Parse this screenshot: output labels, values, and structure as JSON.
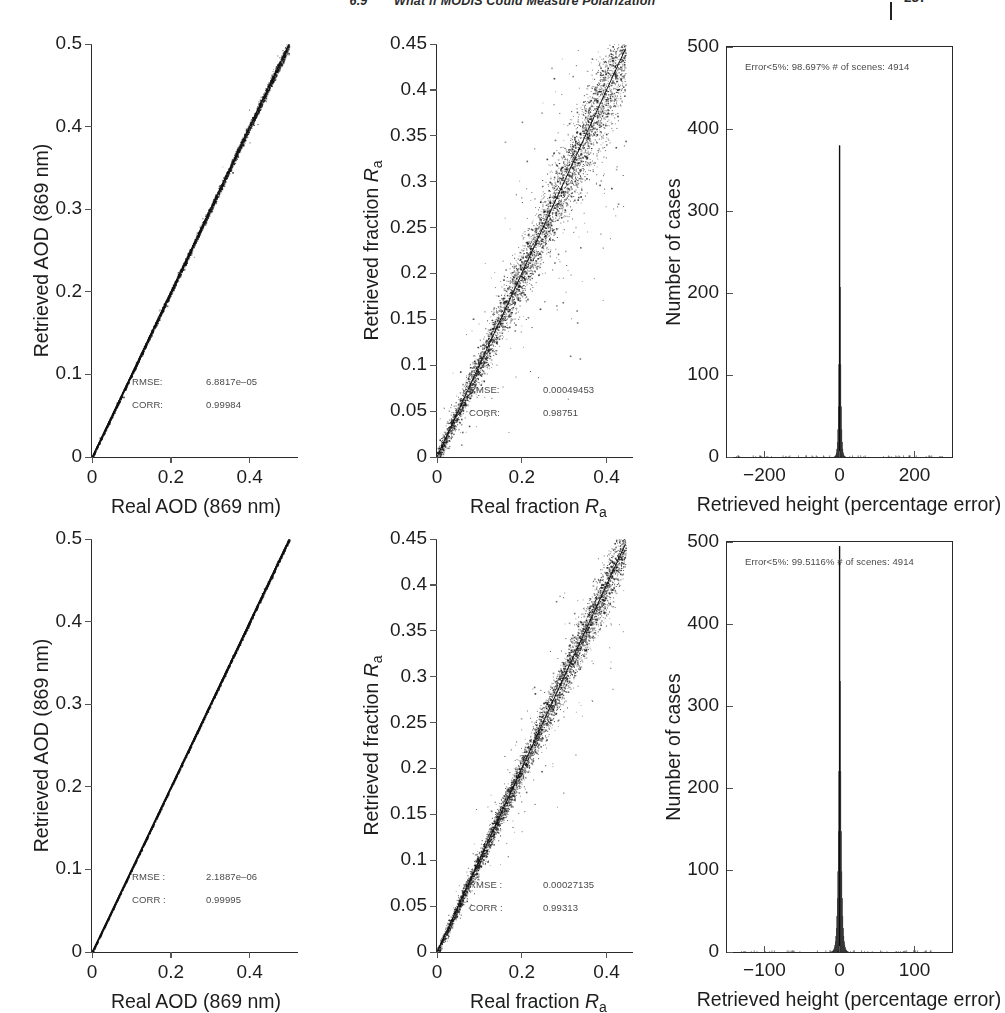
{
  "header": {
    "section": "6.9",
    "title": "What if MODIS Could Measure Polarization",
    "page": "237"
  },
  "chart_data": [
    {
      "id": "panel-top-left",
      "type": "scatter",
      "title": "",
      "xlabel": "Real AOD (869 nm)",
      "ylabel": "Retrieved AOD (869 nm)",
      "xlim": [
        0,
        0.52
      ],
      "ylim": [
        0,
        0.5
      ],
      "xticks": [
        0,
        0.2,
        0.4
      ],
      "xticklabels": [
        "0",
        "0.2",
        "0.4"
      ],
      "yticks": [
        0,
        0.1,
        0.2,
        0.3,
        0.4,
        0.5
      ],
      "yticklabels": [
        "0",
        "0.1",
        "0.2",
        "0.3",
        "0.4",
        "0.5"
      ],
      "grid": false,
      "legend": "none",
      "n_points": 4914,
      "scatter_spread": 0.0035,
      "slope": 1.0,
      "annotations": [
        {
          "label": "RMSE:",
          "value": "6.8817e–05"
        },
        {
          "label": "CORR:",
          "value": "0.99984"
        }
      ]
    },
    {
      "id": "panel-top-middle",
      "type": "scatter",
      "title": "",
      "xlabel": "Real fraction R_a",
      "ylabel": "Retrieved fraction R_a",
      "xlim": [
        0,
        0.46
      ],
      "ylim": [
        0,
        0.45
      ],
      "xticks": [
        0,
        0.2,
        0.4
      ],
      "xticklabels": [
        "0",
        "0.2",
        "0.4"
      ],
      "yticks": [
        0,
        0.05,
        0.1,
        0.15,
        0.2,
        0.25,
        0.3,
        0.35,
        0.4,
        0.45
      ],
      "yticklabels": [
        "0",
        "0.05",
        "0.1",
        "0.15",
        "0.2",
        "0.25",
        "0.3",
        "0.35",
        "0.4",
        "0.45"
      ],
      "grid": false,
      "legend": "none",
      "n_points": 4914,
      "scatter_spread": 0.028,
      "slope": 1.0,
      "annotations": [
        {
          "label": "RMSE:",
          "value": "0.00049453"
        },
        {
          "label": "CORR:",
          "value": "0.98751"
        }
      ]
    },
    {
      "id": "panel-top-right",
      "type": "bar",
      "title": "",
      "xlabel": "Retrieved height (percentage error)",
      "ylabel": "Number of cases",
      "xlim": [
        -300,
        300
      ],
      "ylim": [
        0,
        500
      ],
      "xticks": [
        -200,
        0,
        200
      ],
      "xticklabels": [
        "−200",
        "0",
        "200"
      ],
      "yticks": [
        0,
        100,
        200,
        300,
        400,
        500
      ],
      "yticklabels": [
        "0",
        "100",
        "200",
        "300",
        "400",
        "500"
      ],
      "grid": false,
      "legend": "none",
      "peak_value": 380,
      "peak_center": 0,
      "peak_width": 4,
      "note": "Error<5%: 98.697% # of scenes: 4914"
    },
    {
      "id": "panel-bottom-left",
      "type": "scatter",
      "title": "",
      "xlabel": "Real AOD (869 nm)",
      "ylabel": "Retrieved AOD (869 nm)",
      "xlim": [
        0,
        0.52
      ],
      "ylim": [
        0,
        0.5
      ],
      "xticks": [
        0,
        0.2,
        0.4
      ],
      "xticklabels": [
        "0",
        "0.2",
        "0.4"
      ],
      "yticks": [
        0,
        0.1,
        0.2,
        0.3,
        0.4,
        0.5
      ],
      "yticklabels": [
        "0",
        "0.1",
        "0.2",
        "0.3",
        "0.4",
        "0.5"
      ],
      "grid": false,
      "legend": "none",
      "n_points": 4914,
      "scatter_spread": 0.0012,
      "slope": 1.0,
      "annotations": [
        {
          "label": "RMSE :",
          "value": "2.1887e–06"
        },
        {
          "label": "CORR :",
          "value": "0.99995"
        }
      ]
    },
    {
      "id": "panel-bottom-middle",
      "type": "scatter",
      "title": "",
      "xlabel": "Real fraction R_a",
      "ylabel": "Retrieved fraction R_a",
      "xlim": [
        0,
        0.46
      ],
      "ylim": [
        0,
        0.45
      ],
      "xticks": [
        0,
        0.2,
        0.4
      ],
      "xticklabels": [
        "0",
        "0.2",
        "0.4"
      ],
      "yticks": [
        0,
        0.05,
        0.1,
        0.15,
        0.2,
        0.25,
        0.3,
        0.35,
        0.4,
        0.45
      ],
      "yticklabels": [
        "0",
        "0.05",
        "0.1",
        "0.15",
        "0.2",
        "0.25",
        "0.3",
        "0.35",
        "0.4",
        "0.45"
      ],
      "grid": false,
      "legend": "none",
      "n_points": 4914,
      "scatter_spread": 0.016,
      "slope": 1.0,
      "annotations": [
        {
          "label": "RMSE :",
          "value": "0.00027135"
        },
        {
          "label": "CORR :",
          "value": "0.99313"
        }
      ]
    },
    {
      "id": "panel-bottom-right",
      "type": "bar",
      "title": "",
      "xlabel": "Retrieved height (percentage error)",
      "ylabel": "Number of cases",
      "xlim": [
        -150,
        150
      ],
      "ylim": [
        0,
        500
      ],
      "xticks": [
        -100,
        0,
        100
      ],
      "xticklabels": [
        "−100",
        "0",
        "100"
      ],
      "yticks": [
        0,
        100,
        200,
        300,
        400,
        500
      ],
      "yticklabels": [
        "0",
        "100",
        "200",
        "300",
        "400",
        "500"
      ],
      "grid": false,
      "legend": "none",
      "peak_value": 495,
      "peak_center": 0,
      "peak_width": 3,
      "note": "Error<5%: 99.5116% # of scenes: 4914"
    }
  ],
  "panels": {
    "top_left": {
      "ylabel": "Retrieved AOD (869 nm)",
      "xlabel": "Real AOD (869 nm)",
      "stat1_label": "RMSE:",
      "stat1_value": "6.8817e–05",
      "stat2_label": "CORR:",
      "stat2_value": "0.99984"
    },
    "top_middle": {
      "ylabel_pre": "Retrieved fraction ",
      "xlabel_pre": "Real fraction ",
      "sym": "R",
      "symsub": "a",
      "stat1_label": "RMSE:",
      "stat1_value": "0.00049453",
      "stat2_label": "CORR:",
      "stat2_value": "0.98751"
    },
    "top_right": {
      "ylabel": "Number of cases",
      "xlabel": "Retrieved height (percentage error)",
      "note": "Error<5%: 98.697% # of scenes: 4914"
    },
    "bottom_left": {
      "ylabel": "Retrieved AOD (869 nm)",
      "xlabel": "Real AOD (869 nm)",
      "stat1_label": "RMSE :",
      "stat1_value": "2.1887e–06",
      "stat2_label": "CORR :",
      "stat2_value": "0.99995"
    },
    "bottom_middle": {
      "ylabel_pre": "Retrieved fraction ",
      "xlabel_pre": "Real fraction ",
      "sym": "R",
      "symsub": "a",
      "stat1_label": "RMSE :",
      "stat1_value": "0.00027135",
      "stat2_label": "CORR :",
      "stat2_value": "0.99313"
    },
    "bottom_right": {
      "ylabel": "Number of cases",
      "xlabel": "Retrieved height (percentage error)",
      "note": "Error<5%: 99.5116% # of scenes: 4914"
    }
  },
  "colors": {
    "ink": "#1a1a1a",
    "axis": "#2a2a2a",
    "stat_text": "#4a4a4a",
    "point": "#111111"
  }
}
